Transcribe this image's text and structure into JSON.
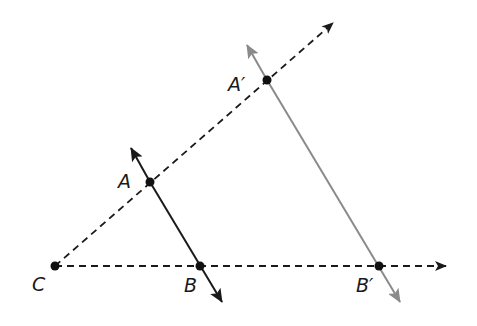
{
  "diagram": {
    "type": "geometric-dilation",
    "colors": {
      "original": "#1a1a1a",
      "image": "#8a8a8a",
      "construction": "#1a1a1a",
      "background": "#ffffff"
    },
    "points": {
      "C": {
        "label": "C",
        "x": 55,
        "y": 266
      },
      "A": {
        "label": "A",
        "x": 150,
        "y": 182
      },
      "B": {
        "label": "B",
        "x": 200,
        "y": 266
      },
      "A_prime": {
        "label": "A′",
        "x": 267,
        "y": 80
      },
      "B_prime": {
        "label": "B′",
        "x": 379,
        "y": 266
      }
    },
    "lines": [
      {
        "name": "ray-CA",
        "from": "C",
        "through": "A_prime",
        "style": "dashed",
        "arrow_end": true
      },
      {
        "name": "ray-CB",
        "from": "C",
        "through": "B_prime",
        "style": "dashed",
        "arrow_end": true
      },
      {
        "name": "line-AB",
        "through": [
          "A",
          "B"
        ],
        "style": "solid",
        "color": "original",
        "arrows": "both"
      },
      {
        "name": "line-A'B'",
        "through": [
          "A_prime",
          "B_prime"
        ],
        "style": "solid",
        "color": "image",
        "arrows": "both"
      }
    ]
  }
}
